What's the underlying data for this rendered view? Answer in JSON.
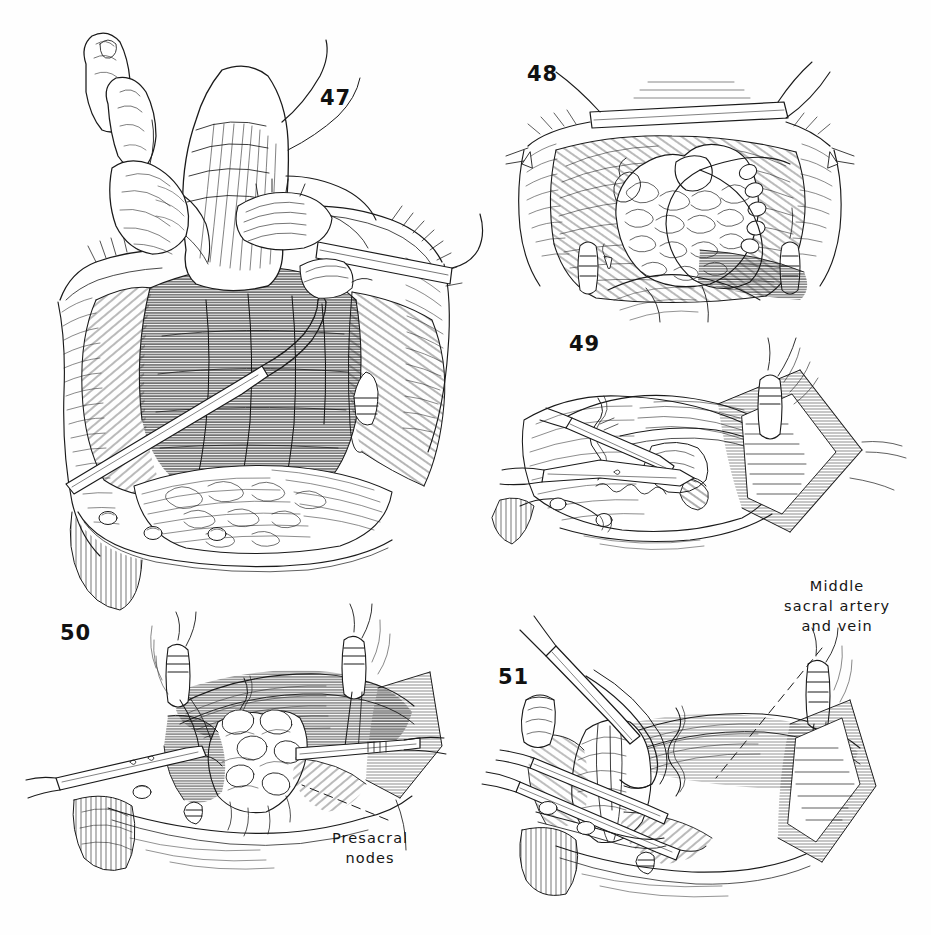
{
  "page": {
    "width": 931,
    "height": 935,
    "background_color": "#fefefe",
    "ink_color": "#1a1a1a",
    "medium": "pen-and-ink line drawing"
  },
  "figures": [
    {
      "id": "fig47",
      "number": "47",
      "number_x": 320,
      "number_y": 86,
      "description": "Surgeon's hand retracting rectosigmoid upward out of opened pelvis; presacral hollow exposed with retractors at wound edges"
    },
    {
      "id": "fig48",
      "number": "48",
      "number_x": 527,
      "number_y": 62,
      "description": "Cross-sectional pelvic view with fatty areolar tissue mass in midline and peritoneal reflection outlined"
    },
    {
      "id": "fig49",
      "number": "49",
      "number_x": 569,
      "number_y": 332,
      "description": "Forceps and scissors dividing tissue plane at the pelvic brim; ligated vessel stump with tie at upper right"
    },
    {
      "id": "fig50",
      "number": "50",
      "number_x": 60,
      "number_y": 621,
      "description": "Presacral space opened showing nodal tissue held between forceps; two ligated vessel stumps superiorly"
    },
    {
      "id": "fig51",
      "number": "51",
      "number_x": 498,
      "number_y": 665,
      "description": "Clamps applied across the presacral tissue pedicle with middle sacral vessels identified"
    }
  ],
  "annotations": [
    {
      "id": "ann-presacral",
      "text": "Presacral\nnodes",
      "x": 332,
      "y": 828,
      "align": "center",
      "leader": {
        "from_x": 388,
        "from_y": 820,
        "to_x": 302,
        "to_y": 785,
        "style": "dashed"
      }
    },
    {
      "id": "ann-middle-sacral",
      "text": "Middle\nsacral artery\nand vein",
      "x": 784,
      "y": 576,
      "align": "center",
      "leader": {
        "from_x": 822,
        "from_y": 648,
        "to_x": 716,
        "to_y": 778,
        "style": "dashed"
      }
    }
  ]
}
